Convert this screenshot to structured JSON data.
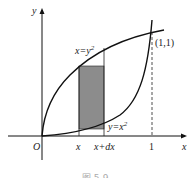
{
  "diagram": {
    "axes": {
      "x_label": "x",
      "y_label": "y",
      "origin_label": "O"
    },
    "curves": [
      {
        "name": "upper",
        "equation": "x=y",
        "exponent": "2"
      },
      {
        "name": "lower",
        "equation": "y=x",
        "exponent": "2"
      }
    ],
    "intersection_label": "(1,1)",
    "ticks": {
      "x": "x",
      "x_dx": "x+dx",
      "one": "1"
    },
    "caption": "图 5-9",
    "colors": {
      "strip_fill": "#8c8c8c",
      "line": "#111111"
    }
  }
}
